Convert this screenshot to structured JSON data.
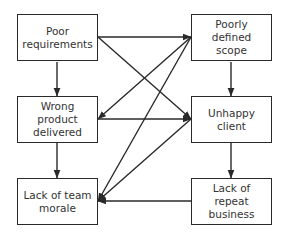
{
  "diagram": {
    "type": "cause-effect flowchart",
    "colors": {
      "stroke": "#2a2a2a",
      "text": "#333333",
      "background": "#ffffff"
    },
    "nodes": [
      {
        "id": "poor_requirements",
        "label": "Poor\nrequirements",
        "x": 17,
        "y": 14
      },
      {
        "id": "poorly_defined_scope",
        "label": "Poorly defined\nscope",
        "x": 191,
        "y": 14
      },
      {
        "id": "wrong_product_delivered",
        "label": "Wrong product\ndelivered",
        "x": 17,
        "y": 96
      },
      {
        "id": "unhappy_client",
        "label": "Unhappy\nclient",
        "x": 191,
        "y": 96
      },
      {
        "id": "lack_of_team_morale",
        "label": "Lack of team\nmorale",
        "x": 17,
        "y": 178
      },
      {
        "id": "lack_of_repeat_business",
        "label": "Lack of repeat\nbusiness",
        "x": 191,
        "y": 178
      }
    ],
    "edges": [
      {
        "from": "poor_requirements",
        "to": "poorly_defined_scope",
        "x1": 98,
        "y1": 37,
        "x2": 191,
        "y2": 37
      },
      {
        "from": "poor_requirements",
        "to": "unhappy_client",
        "x1": 98,
        "y1": 37,
        "x2": 191,
        "y2": 119
      },
      {
        "from": "poor_requirements",
        "to": "wrong_product_delivered",
        "x1": 57,
        "y1": 62,
        "x2": 57,
        "y2": 96
      },
      {
        "from": "poorly_defined_scope",
        "to": "unhappy_client",
        "x1": 231,
        "y1": 62,
        "x2": 231,
        "y2": 96
      },
      {
        "from": "poorly_defined_scope",
        "to": "wrong_product_delivered",
        "x1": 191,
        "y1": 37,
        "x2": 98,
        "y2": 119
      },
      {
        "from": "poorly_defined_scope",
        "to": "lack_of_team_morale",
        "x1": 191,
        "y1": 37,
        "x2": 98,
        "y2": 201
      },
      {
        "from": "wrong_product_delivered",
        "to": "unhappy_client",
        "x1": 98,
        "y1": 119,
        "x2": 191,
        "y2": 119
      },
      {
        "from": "wrong_product_delivered",
        "to": "lack_of_team_morale",
        "x1": 57,
        "y1": 143,
        "x2": 57,
        "y2": 178
      },
      {
        "from": "unhappy_client",
        "to": "lack_of_team_morale",
        "x1": 191,
        "y1": 119,
        "x2": 98,
        "y2": 201
      },
      {
        "from": "unhappy_client",
        "to": "lack_of_repeat_business",
        "x1": 231,
        "y1": 143,
        "x2": 231,
        "y2": 178
      },
      {
        "from": "lack_of_repeat_business",
        "to": "lack_of_team_morale",
        "x1": 191,
        "y1": 201,
        "x2": 98,
        "y2": 201
      }
    ]
  }
}
